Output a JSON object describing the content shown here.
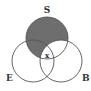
{
  "diagram": {
    "type": "venn",
    "circles": [
      {
        "id": "S",
        "label": "S",
        "cx": 47,
        "cy": 38,
        "r": 21
      },
      {
        "id": "E",
        "label": "E",
        "cx": 33,
        "cy": 61,
        "r": 21
      },
      {
        "id": "B",
        "label": "B",
        "cx": 61,
        "cy": 61,
        "r": 21
      }
    ],
    "shaded_regions": [
      "S only",
      "S and E not B"
    ],
    "marked_regions": [
      {
        "region": "S and E and B",
        "mark": "x"
      }
    ],
    "colors": {
      "shade": "#6e6e6e",
      "stroke": "#555555",
      "background": "#ffffff"
    },
    "labels": {
      "s": "S",
      "e": "E",
      "b": "B",
      "x": "x"
    }
  }
}
